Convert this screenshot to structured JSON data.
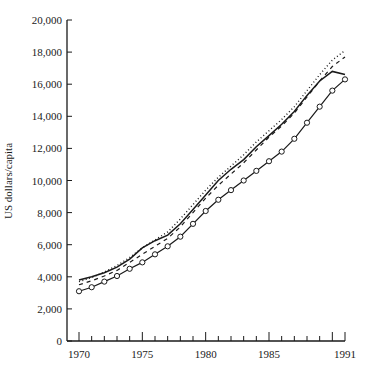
{
  "chart_data": {
    "type": "line",
    "title": "",
    "xlabel": "",
    "ylabel": "US dollars/capita",
    "xlim": [
      1970,
      1991
    ],
    "ylim": [
      0,
      20000
    ],
    "grid": false,
    "legend": null,
    "x_tick_labels": [
      "1970",
      "1975",
      "1980",
      "1985",
      "1991"
    ],
    "y_tick_labels": [
      "0",
      "2,000",
      "4,000",
      "6,000",
      "8,000",
      "10,000",
      "12,000",
      "14,000",
      "16,000",
      "18,000",
      "20,000"
    ],
    "x": [
      1970,
      1971,
      1972,
      1973,
      1974,
      1975,
      1976,
      1977,
      1978,
      1979,
      1980,
      1981,
      1982,
      1983,
      1984,
      1985,
      1986,
      1987,
      1988,
      1989,
      1990,
      1991
    ],
    "series": [
      {
        "name": "solid",
        "style": "solid",
        "values": [
          3800,
          4000,
          4250,
          4600,
          5100,
          5800,
          6250,
          6600,
          7300,
          8200,
          9100,
          10000,
          10700,
          11300,
          12100,
          12800,
          13500,
          14300,
          15300,
          16200,
          16800,
          16600
        ]
      },
      {
        "name": "dashed",
        "style": "dashed",
        "values": [
          3500,
          3750,
          4050,
          4400,
          4900,
          5400,
          5900,
          6400,
          7100,
          8000,
          8900,
          9700,
          10400,
          11100,
          11900,
          12700,
          13400,
          14200,
          15200,
          16200,
          17100,
          17700
        ]
      },
      {
        "name": "dotted",
        "style": "dotted",
        "values": [
          3700,
          3950,
          4300,
          4700,
          5200,
          5800,
          6300,
          6800,
          7600,
          8500,
          9400,
          10200,
          10900,
          11600,
          12400,
          13100,
          13800,
          14600,
          15600,
          16600,
          17500,
          18100
        ]
      },
      {
        "name": "circles",
        "style": "solid-with-open-circle-markers",
        "values": [
          3100,
          3350,
          3700,
          4050,
          4500,
          4900,
          5400,
          5900,
          6500,
          7300,
          8100,
          8800,
          9400,
          10000,
          10600,
          11200,
          11800,
          12600,
          13600,
          14600,
          15600,
          16300
        ]
      }
    ]
  },
  "layout": {
    "plot_left": 67,
    "plot_bottom": 341,
    "plot_top": 20,
    "x_first": 79,
    "x_last": 345,
    "line_color": "#1a1a1a"
  }
}
